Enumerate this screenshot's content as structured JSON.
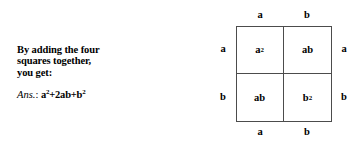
{
  "instruction": {
    "lines": [
      "By adding the four",
      "squares together,",
      "you get:"
    ]
  },
  "answer": {
    "label": "Ans.",
    "colon": ":",
    "base": "a",
    "expression_plain": "a²+2ab+b²",
    "term1_base": "a",
    "term1_sup": "2",
    "term2": "+2ab+",
    "term3_base": "b",
    "term3_sup": "2"
  },
  "diagram": {
    "type": "area-model-square",
    "top_labels": [
      "a",
      "b"
    ],
    "bottom_labels": [
      "a",
      "b"
    ],
    "left_labels": [
      "a",
      "b"
    ],
    "right_labels": [
      "a",
      "b"
    ],
    "cells": [
      {
        "position": "top-left",
        "base": "a",
        "sup": "2",
        "text": "a²"
      },
      {
        "position": "top-right",
        "base": "ab",
        "sup": "",
        "text": "ab"
      },
      {
        "position": "bottom-left",
        "base": "ab",
        "sup": "",
        "text": "ab"
      },
      {
        "position": "bottom-right",
        "base": "b",
        "sup": "2",
        "text": "b²"
      }
    ],
    "line_color": "#4c4c4c",
    "background_color": "#ffffff"
  }
}
